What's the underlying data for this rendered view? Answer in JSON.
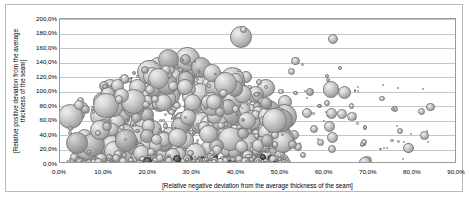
{
  "chart": {
    "type": "scatter",
    "background_color": "#ffffff",
    "frame_color": "#b9b9b9",
    "plot_border_color": "#9a9a9a",
    "gridline_color": "#c6c6c6",
    "bubble_fill": "#b0b0b0",
    "bubble_outline": "#7c7c7c"
  },
  "chart_data": {
    "type": "scatter",
    "title": "",
    "subtitle": "",
    "xlabel": "[Relative negative deviation from the average thickness  of the seam]",
    "ylabel": "[Relative positive deviation from the average thickness  of the seam]",
    "ylabel_lines": [
      "[Relative positive deviation from the average",
      "thickness  of the seam]"
    ],
    "xlim": [
      0,
      90
    ],
    "ylim": [
      0,
      200
    ],
    "x_tick_labels": [
      "0,0%",
      "10,0%",
      "20,0%",
      "30,0%",
      "40,0%",
      "50,0%",
      "60,0%",
      "70,0%",
      "80,0%",
      "90,0%"
    ],
    "x_tick_values": [
      0,
      10,
      20,
      30,
      40,
      50,
      60,
      70,
      80,
      90
    ],
    "y_tick_labels": [
      "0,0%",
      "20,0%",
      "40,0%",
      "60,0%",
      "80,0%",
      "100,0%",
      "120,0%",
      "140,0%",
      "160,0%",
      "180,0%",
      "200,0%"
    ],
    "y_tick_values": [
      0,
      20,
      40,
      60,
      80,
      100,
      120,
      140,
      160,
      180,
      200
    ],
    "grid": "horizontal",
    "legend": "none",
    "marker_style": "bubble-3d-gray",
    "series": [
      {
        "name": "Seam thickness deviation",
        "points": [
          {
            "x": 2.0,
            "y": 2.0,
            "r": 2.6
          },
          {
            "x": 3.1,
            "y": 3.0,
            "r": 3.4
          },
          {
            "x": 4.2,
            "y": 1.6,
            "r": 2.1
          },
          {
            "x": 5.0,
            "y": 4.0,
            "r": 3.8
          },
          {
            "x": 5.8,
            "y": 2.2,
            "r": 2.4
          },
          {
            "x": 6.6,
            "y": 6.0,
            "r": 4.4
          },
          {
            "x": 7.4,
            "y": 2.8,
            "r": 2.8
          },
          {
            "x": 8.0,
            "y": 9.0,
            "r": 5.2
          },
          {
            "x": 8.8,
            "y": 3.4,
            "r": 2.6
          },
          {
            "x": 9.4,
            "y": 5.5,
            "r": 3.6
          },
          {
            "x": 10.2,
            "y": 2.0,
            "r": 2.2
          },
          {
            "x": 11.0,
            "y": 70.0,
            "r": 14.5
          },
          {
            "x": 11.4,
            "y": 42.0,
            "r": 9.0
          },
          {
            "x": 12.2,
            "y": 24.0,
            "r": 7.0
          },
          {
            "x": 12.8,
            "y": 12.0,
            "r": 5.0
          },
          {
            "x": 13.4,
            "y": 5.0,
            "r": 3.2
          },
          {
            "x": 14.2,
            "y": 62.0,
            "r": 12.0
          },
          {
            "x": 14.8,
            "y": 34.0,
            "r": 8.0
          },
          {
            "x": 15.4,
            "y": 18.0,
            "r": 6.0
          },
          {
            "x": 16.0,
            "y": 8.0,
            "r": 4.0
          },
          {
            "x": 16.8,
            "y": 3.0,
            "r": 2.4
          },
          {
            "x": 17.4,
            "y": 55.0,
            "r": 11.0
          },
          {
            "x": 18.0,
            "y": 30.0,
            "r": 7.5
          },
          {
            "x": 18.8,
            "y": 14.0,
            "r": 5.2
          },
          {
            "x": 19.4,
            "y": 6.0,
            "r": 3.4
          },
          {
            "x": 20.2,
            "y": 2.5,
            "r": 2.2
          },
          {
            "x": 21.0,
            "y": 48.0,
            "r": 9.5
          },
          {
            "x": 21.8,
            "y": 26.0,
            "r": 6.8
          },
          {
            "x": 22.4,
            "y": 12.0,
            "r": 4.6
          },
          {
            "x": 23.2,
            "y": 5.0,
            "r": 3.0
          },
          {
            "x": 24.0,
            "y": 120.0,
            "r": 1.0
          },
          {
            "x": 24.8,
            "y": 40.0,
            "r": 8.5
          },
          {
            "x": 25.4,
            "y": 20.0,
            "r": 6.0
          },
          {
            "x": 26.2,
            "y": 9.0,
            "r": 4.0
          },
          {
            "x": 27.0,
            "y": 3.5,
            "r": 2.4
          },
          {
            "x": 28.0,
            "y": 58.0,
            "r": 10.0
          },
          {
            "x": 28.8,
            "y": 32.0,
            "r": 7.2
          },
          {
            "x": 29.6,
            "y": 15.0,
            "r": 5.0
          },
          {
            "x": 30.2,
            "y": 6.5,
            "r": 3.2
          },
          {
            "x": 31.0,
            "y": 130.0,
            "r": 9.0
          },
          {
            "x": 31.8,
            "y": 110.0,
            "r": 11.0
          },
          {
            "x": 32.4,
            "y": 90.0,
            "r": 9.5
          },
          {
            "x": 33.0,
            "y": 70.0,
            "r": 8.0
          },
          {
            "x": 33.8,
            "y": 48.0,
            "r": 7.0
          },
          {
            "x": 34.4,
            "y": 28.0,
            "r": 6.0
          },
          {
            "x": 35.0,
            "y": 14.0,
            "r": 4.6
          },
          {
            "x": 35.8,
            "y": 5.0,
            "r": 2.8
          },
          {
            "x": 36.4,
            "y": 108.0,
            "r": 5.0
          },
          {
            "x": 37.0,
            "y": 122.0,
            "r": 4.0
          },
          {
            "x": 37.8,
            "y": 86.0,
            "r": 8.5
          },
          {
            "x": 38.4,
            "y": 62.0,
            "r": 7.5
          },
          {
            "x": 39.0,
            "y": 40.0,
            "r": 6.5
          },
          {
            "x": 39.8,
            "y": 22.0,
            "r": 5.4
          },
          {
            "x": 40.4,
            "y": 10.0,
            "r": 3.8
          },
          {
            "x": 41.0,
            "y": 175.0,
            "r": 11.0
          },
          {
            "x": 41.6,
            "y": 186.0,
            "r": 3.5
          },
          {
            "x": 42.2,
            "y": 120.0,
            "r": 6.0
          },
          {
            "x": 42.8,
            "y": 95.0,
            "r": 7.0
          },
          {
            "x": 43.4,
            "y": 72.0,
            "r": 8.0
          },
          {
            "x": 44.0,
            "y": 52.0,
            "r": 7.0
          },
          {
            "x": 44.8,
            "y": 33.0,
            "r": 6.0
          },
          {
            "x": 45.4,
            "y": 18.0,
            "r": 5.0
          },
          {
            "x": 46.0,
            "y": 8.0,
            "r": 3.4
          },
          {
            "x": 46.8,
            "y": 105.0,
            "r": 9.0
          },
          {
            "x": 47.4,
            "y": 78.0,
            "r": 7.5
          },
          {
            "x": 48.0,
            "y": 55.0,
            "r": 6.5
          },
          {
            "x": 48.8,
            "y": 36.0,
            "r": 5.5
          },
          {
            "x": 49.4,
            "y": 20.0,
            "r": 4.5
          },
          {
            "x": 50.2,
            "y": 9.0,
            "r": 3.0
          },
          {
            "x": 51.0,
            "y": 86.0,
            "r": 7.0
          },
          {
            "x": 52.0,
            "y": 60.0,
            "r": 6.0
          },
          {
            "x": 53.0,
            "y": 40.0,
            "r": 5.0
          },
          {
            "x": 54.0,
            "y": 24.0,
            "r": 4.0
          },
          {
            "x": 55.0,
            "y": 12.0,
            "r": 3.0
          },
          {
            "x": 56.0,
            "y": 70.0,
            "r": 5.0
          },
          {
            "x": 57.5,
            "y": 48.0,
            "r": 4.0
          },
          {
            "x": 59.0,
            "y": 30.0,
            "r": 3.4
          },
          {
            "x": 60.5,
            "y": 84.0,
            "r": 3.0
          },
          {
            "x": 62.0,
            "y": 172.0,
            "r": 5.0
          },
          {
            "x": 63.5,
            "y": 132.0,
            "r": 2.0
          },
          {
            "x": 64.5,
            "y": 98.0,
            "r": 6.5
          },
          {
            "x": 66.0,
            "y": 80.0,
            "r": 2.6
          },
          {
            "x": 67.5,
            "y": 56.0,
            "r": 1.4
          },
          {
            "x": 69.0,
            "y": 30.0,
            "r": 3.0
          },
          {
            "x": 73.0,
            "y": 90.0,
            "r": 2.6
          },
          {
            "x": 76.0,
            "y": 76.0,
            "r": 3.2
          },
          {
            "x": 78.0,
            "y": 30.0,
            "r": 0.9
          },
          {
            "x": 82.0,
            "y": 72.0,
            "r": 3.4
          },
          {
            "x": 83.5,
            "y": 30.0,
            "r": 0.9
          }
        ]
      }
    ]
  },
  "axes": {
    "y_ticks": [
      {
        "label": "200,0%",
        "value": 200
      },
      {
        "label": "180,0%",
        "value": 180
      },
      {
        "label": "160,0%",
        "value": 160
      },
      {
        "label": "140,0%",
        "value": 140
      },
      {
        "label": "120,0%",
        "value": 120
      },
      {
        "label": "100,0%",
        "value": 100
      },
      {
        "label": "80,0%",
        "value": 80
      },
      {
        "label": "60,0%",
        "value": 60
      },
      {
        "label": "40,0%",
        "value": 40
      },
      {
        "label": "20,0%",
        "value": 20
      },
      {
        "label": "0,0%",
        "value": 0
      }
    ],
    "x_ticks": [
      {
        "label": "0,0%",
        "value": 0
      },
      {
        "label": "10,0%",
        "value": 10
      },
      {
        "label": "20,0%",
        "value": 20
      },
      {
        "label": "30,0%",
        "value": 30
      },
      {
        "label": "40,0%",
        "value": 40
      },
      {
        "label": "50,0%",
        "value": 50
      },
      {
        "label": "60,0%",
        "value": 60
      },
      {
        "label": "70,0%",
        "value": 70
      },
      {
        "label": "80,0%",
        "value": 80
      },
      {
        "label": "90,0%",
        "value": 90
      }
    ],
    "x_title": "[Relative negative deviation from the average thickness  of the seam]",
    "y_title_line1": "[Relative positive deviation from the average",
    "y_title_line2": "thickness  of the seam]"
  }
}
